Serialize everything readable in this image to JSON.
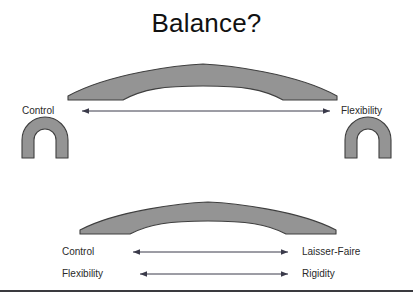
{
  "slide": {
    "title": "Balance?",
    "background_color": "#ffffff",
    "width": 413,
    "height": 303
  },
  "colors": {
    "shape_fill": "#949494",
    "shape_stroke": "#3f3f3f",
    "text": "#2a2a2a",
    "title_text": "#111111",
    "arrow": "#3a3a4a",
    "rule": "#3a3a3f"
  },
  "top_diagram": {
    "left_label": "Control",
    "right_label": "Flexibility",
    "arrow": {
      "type": "double-headed",
      "from_x": 82,
      "to_x": 330,
      "y": 111
    },
    "beam": {
      "shape": "crescent-arch",
      "left_x": 68,
      "right_x": 337,
      "top_y": 72,
      "bottom_y": 100
    },
    "supports": [
      {
        "name": "left-arch",
        "shape": "horseshoe-arch",
        "cx": 45,
        "cy": 155
      },
      {
        "name": "right-arch",
        "shape": "horseshoe-arch",
        "cx": 368,
        "cy": 155
      }
    ]
  },
  "bottom_diagram": {
    "beam": {
      "shape": "crescent-arch",
      "left_x": 80,
      "right_x": 336,
      "top_y": 208,
      "bottom_y": 234
    },
    "rows": [
      {
        "left_label": "Control",
        "right_label": "Laisser-Faire",
        "arrow": {
          "type": "double-headed",
          "from_x": 133,
          "to_x": 288,
          "y": 252
        }
      },
      {
        "left_label": "Flexibility",
        "right_label": "Rigidity",
        "arrow": {
          "type": "double-headed",
          "from_x": 140,
          "to_x": 288,
          "y": 274
        }
      }
    ]
  }
}
